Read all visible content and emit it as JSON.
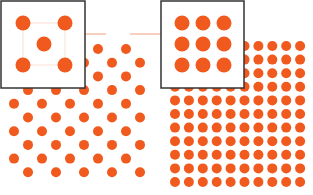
{
  "diagram": {
    "title": "",
    "dot_color": "#f05a1e",
    "left_pattern": {
      "arrangement": "staggered",
      "label": ""
    },
    "right_pattern": {
      "arrangement": "square-grid",
      "label": ""
    },
    "left_inset": {
      "dots": 5,
      "arrangement": "quincunx"
    },
    "right_inset": {
      "dots": 9,
      "arrangement": "3x3 grid"
    },
    "arrow_color": "#f0a080"
  }
}
